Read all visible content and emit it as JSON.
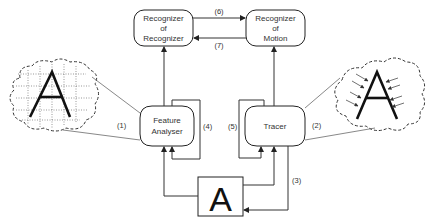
{
  "diagram": {
    "nodes": {
      "recognizer_of_recognizer": {
        "line1": "Recognizer",
        "line2": "of",
        "line3": "Recognizer"
      },
      "recognizer_of_motion": {
        "line1": "Recognizer",
        "line2": "of",
        "line3": "Motion"
      },
      "feature_analyser": {
        "line1": "Feature",
        "line2": "Analyser"
      },
      "tracer": {
        "line1": "Tracer"
      },
      "stimulus": {
        "letter": "A"
      }
    },
    "clouds": {
      "left": {
        "letter": "A",
        "style": "dotted-grid"
      },
      "right": {
        "letter": "A",
        "style": "arrows-pointing-at-letter"
      }
    },
    "edge_labels": {
      "e1": "(1)",
      "e2": "(2)",
      "e3": "(3)",
      "e4": "(4)",
      "e5": "(5)",
      "e6": "(6)",
      "e7": "(7)"
    },
    "edges": [
      {
        "from": "stimulus",
        "to": "feature_analyser"
      },
      {
        "from": "stimulus",
        "to": "tracer"
      },
      {
        "from": "tracer",
        "to": "stimulus",
        "label": "(3)"
      },
      {
        "from": "feature_analyser",
        "to": "feature_analyser",
        "label": "(4)"
      },
      {
        "from": "tracer",
        "to": "tracer",
        "label": "(5)"
      },
      {
        "from": "feature_analyser",
        "to": "recognizer_of_recognizer"
      },
      {
        "from": "tracer",
        "to": "recognizer_of_motion"
      },
      {
        "from": "recognizer_of_recognizer",
        "to": "recognizer_of_motion",
        "label": "(6)"
      },
      {
        "from": "recognizer_of_motion",
        "to": "recognizer_of_recognizer",
        "label": "(7)"
      },
      {
        "from": "left_cloud",
        "to": "feature_analyser",
        "label": "(1)"
      },
      {
        "from": "right_cloud",
        "to": "tracer",
        "label": "(2)"
      }
    ]
  }
}
